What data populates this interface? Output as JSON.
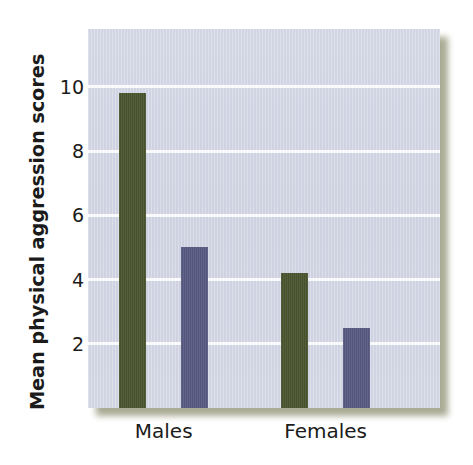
{
  "chart_data": {
    "type": "bar",
    "title": "",
    "xlabel": "",
    "ylabel": "Mean physical aggression scores",
    "categories": [
      "Males",
      "Females"
    ],
    "series": [
      {
        "name": "green-series",
        "color": "#4c552f",
        "values": [
          9.8,
          4.2
        ]
      },
      {
        "name": "purple-series",
        "color": "#5a5b82",
        "values": [
          5.0,
          2.5
        ]
      }
    ],
    "yticks": [
      2,
      4,
      6,
      8,
      10
    ],
    "ytick_labels": [
      "2",
      "4",
      "6",
      "8",
      "10"
    ],
    "ylim": [
      0,
      11.8
    ],
    "xtick_labels": [
      "Males",
      "Females"
    ],
    "grid": "horizontal",
    "legend": "none",
    "plot_background": "#cfd3e1",
    "gridline_color": "#fbfbfd",
    "panel_shadow_color": "#8e8f70"
  },
  "axis": {
    "y_title": "Mean physical aggression scores",
    "y_tick_2": "2",
    "y_tick_4": "4",
    "y_tick_6": "6",
    "y_tick_8": "8",
    "y_tick_10": "10",
    "x_tick_males": "Males",
    "x_tick_females": "Females"
  }
}
